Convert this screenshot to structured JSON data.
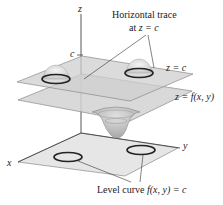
{
  "figure": {
    "axes": {
      "z": "z",
      "x": "x",
      "y": "y",
      "c_tick": "c"
    },
    "labels": {
      "horizontal_trace_line1": "Horizontal trace",
      "horizontal_trace_line2_prefix": "at ",
      "horizontal_trace_line2_expr": "z = c",
      "plane_top": "z = c",
      "surface": "z = f(x, y)",
      "level_curve_prefix": "Level curve ",
      "level_curve_expr": "f(x, y) = c"
    },
    "colors": {
      "plane_fill": "#d4d4d4",
      "plane_edge": "#8a8a8a",
      "curve": "#222222",
      "surface_fill": "#bdbdbd"
    }
  }
}
